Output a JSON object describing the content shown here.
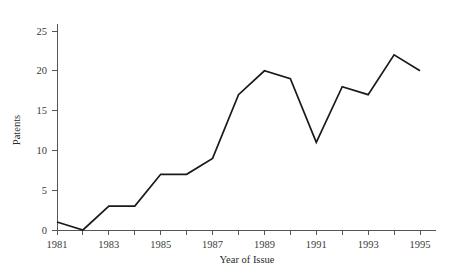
{
  "chart_data": {
    "type": "line",
    "title": "",
    "subtitle": "",
    "xlabel": "Year of Issue",
    "ylabel": "Patents",
    "x": [
      1981,
      1982,
      1983,
      1984,
      1985,
      1986,
      1987,
      1988,
      1989,
      1990,
      1991,
      1992,
      1993,
      1994,
      1995
    ],
    "values": [
      1,
      0,
      3,
      3,
      7,
      7,
      9,
      17,
      20,
      19,
      11,
      18,
      17,
      22,
      20
    ],
    "series": [
      {
        "name": "Patents",
        "values": [
          1,
          0,
          3,
          3,
          7,
          7,
          9,
          17,
          20,
          19,
          11,
          18,
          17,
          22,
          20
        ],
        "color": "#1a1a1a"
      }
    ],
    "xlim": [
      1981,
      1995
    ],
    "ylim": [
      0,
      26
    ],
    "ytick_values": [
      0,
      5,
      10,
      15,
      20,
      25
    ],
    "ytick_labels": [
      "0",
      "5",
      "10",
      "15",
      "20",
      "25"
    ],
    "xtick_values": [
      1981,
      1982,
      1983,
      1984,
      1985,
      1986,
      1987,
      1988,
      1989,
      1990,
      1991,
      1992,
      1993,
      1994,
      1995
    ],
    "xtick_labels": [
      "1981",
      "",
      "1983",
      "",
      "1985",
      "",
      "1987",
      "",
      "1989",
      "",
      "1991",
      "",
      "1993",
      "",
      "1995"
    ],
    "grid": false,
    "legend": false,
    "legend_position": "none",
    "annotations": []
  },
  "axes": {
    "y_axis_label": "Patents",
    "x_axis_label": "Year of Issue"
  }
}
